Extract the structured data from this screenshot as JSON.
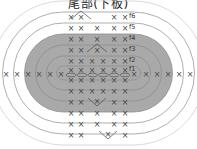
{
  "title": "尾部(下板)",
  "colors": {
    "shaded_fill": "#a9a9a9",
    "ring_stroke": "#9a9a9a",
    "ring_stroke_light": "#c8c8c8",
    "stitch": "#4a4a4a",
    "background": "#ffffff"
  },
  "legend": {
    "single_crochet_symbol": "×",
    "increase_symbol": "V",
    "chain_symbol": "○"
  },
  "rounds": [
    {
      "label": "f1",
      "shaded": true
    },
    {
      "label": "f2",
      "shaded": true
    },
    {
      "label": "f3",
      "shaded": true
    },
    {
      "label": "f4",
      "shaded": true
    },
    {
      "label": "f5",
      "shaded": false
    },
    {
      "label": "f6",
      "shaded": false
    }
  ],
  "top_rows": [
    {
      "round": "f6",
      "stitches": [
        "×",
        "V",
        "",
        "×",
        "×"
      ]
    },
    {
      "round": "f5",
      "stitches": [
        "×",
        "×",
        "×",
        "×",
        "×"
      ]
    },
    {
      "round": "f4",
      "stitches": [
        "×",
        "×",
        "×",
        "×",
        "×"
      ]
    },
    {
      "round": "f3",
      "stitches": [
        "×",
        "×",
        "V",
        "×",
        "×"
      ]
    },
    {
      "round": "f2",
      "stitches": [
        "×",
        "×",
        "×",
        "×",
        "×",
        "×"
      ]
    },
    {
      "round": "f1",
      "stitches": [
        "×",
        "×",
        "×",
        "×",
        "×",
        "×"
      ]
    }
  ],
  "bottom_rows": [
    {
      "stitches": [
        "×",
        "×",
        "×",
        "×",
        "×",
        "×"
      ]
    },
    {
      "stitches": [
        "×",
        "×",
        "×",
        "×",
        "×",
        "×"
      ]
    },
    {
      "stitches": [
        "×",
        "×",
        "V",
        "×",
        "×"
      ]
    },
    {
      "stitches": [
        "×",
        "×",
        "×",
        "×",
        "×"
      ]
    },
    {
      "stitches": [
        "×",
        "×",
        "×",
        "×",
        "×"
      ]
    },
    {
      "stitches": [
        "×",
        "×",
        "V",
        "×"
      ]
    }
  ],
  "side_left": [
    "×",
    "×",
    "×",
    "×",
    "×",
    "×"
  ],
  "side_right": [
    "×",
    "×",
    "×",
    "×",
    "×"
  ],
  "foundation_chain_count": 6
}
